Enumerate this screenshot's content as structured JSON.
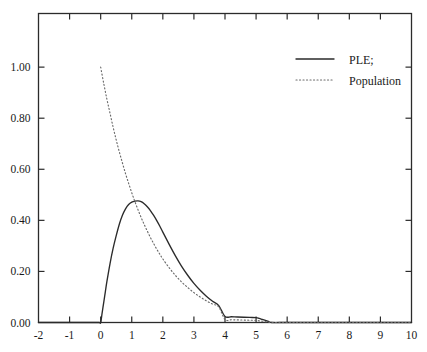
{
  "chart_data": {
    "type": "line",
    "title": "",
    "subtitle": "",
    "xlabel": "",
    "ylabel": "",
    "xlim": [
      -2,
      10
    ],
    "ylim": [
      0,
      1.21
    ],
    "grid": false,
    "legend_position": "top-right",
    "x_ticks": [
      "-2",
      "-1",
      "0",
      "1",
      "2",
      "3",
      "4",
      "5",
      "6",
      "7",
      "8",
      "9",
      "10"
    ],
    "x_tick_values": [
      -2,
      -1,
      0,
      1,
      2,
      3,
      4,
      5,
      6,
      7,
      8,
      9,
      10
    ],
    "y_ticks": [
      "0.00",
      "0.20",
      "0.40",
      "0.60",
      "0.80",
      "1.00"
    ],
    "y_tick_values": [
      0.0,
      0.2,
      0.4,
      0.6,
      0.8,
      1.0
    ],
    "legend": [
      {
        "label": "PLE;",
        "style": "solid"
      },
      {
        "label": "Population",
        "style": "dotted"
      }
    ],
    "series": [
      {
        "name": "PLE;",
        "style": "solid",
        "color": "#2b2b2b",
        "points": [
          [
            -2.0,
            0.0
          ],
          [
            -1.0,
            0.0
          ],
          [
            -0.3,
            0.0
          ],
          [
            -0.05,
            0.0
          ],
          [
            0.0,
            0.0
          ],
          [
            0.05,
            0.04
          ],
          [
            0.1,
            0.08
          ],
          [
            0.15,
            0.12
          ],
          [
            0.2,
            0.16
          ],
          [
            0.3,
            0.23
          ],
          [
            0.4,
            0.29
          ],
          [
            0.5,
            0.34
          ],
          [
            0.6,
            0.385
          ],
          [
            0.7,
            0.42
          ],
          [
            0.8,
            0.445
          ],
          [
            0.9,
            0.462
          ],
          [
            1.0,
            0.471
          ],
          [
            1.1,
            0.475
          ],
          [
            1.2,
            0.476
          ],
          [
            1.3,
            0.473
          ],
          [
            1.4,
            0.465
          ],
          [
            1.5,
            0.453
          ],
          [
            1.6,
            0.438
          ],
          [
            1.7,
            0.42
          ],
          [
            1.8,
            0.4
          ],
          [
            1.9,
            0.378
          ],
          [
            2.0,
            0.354
          ],
          [
            2.2,
            0.307
          ],
          [
            2.4,
            0.262
          ],
          [
            2.6,
            0.221
          ],
          [
            2.8,
            0.185
          ],
          [
            3.0,
            0.153
          ],
          [
            3.2,
            0.126
          ],
          [
            3.4,
            0.103
          ],
          [
            3.6,
            0.083
          ],
          [
            3.8,
            0.066
          ],
          [
            4.0,
            0.0235
          ],
          [
            4.2,
            0.0225
          ],
          [
            4.4,
            0.0215
          ],
          [
            4.6,
            0.0205
          ],
          [
            4.8,
            0.0198
          ],
          [
            5.0,
            0.0192
          ],
          [
            5.1,
            0.016
          ],
          [
            5.2,
            0.012
          ],
          [
            5.3,
            0.008
          ],
          [
            5.4,
            0.004
          ],
          [
            5.5,
            0.0
          ],
          [
            6.0,
            0.0
          ],
          [
            7.0,
            0.0
          ],
          [
            8.0,
            0.0
          ],
          [
            9.0,
            0.0
          ],
          [
            10.0,
            0.0
          ]
        ]
      },
      {
        "name": "Population",
        "style": "dotted",
        "color": "#6a6a6a",
        "points": [
          [
            0.0,
            1.0
          ],
          [
            0.1,
            0.935
          ],
          [
            0.2,
            0.875
          ],
          [
            0.3,
            0.82
          ],
          [
            0.4,
            0.765
          ],
          [
            0.5,
            0.715
          ],
          [
            0.6,
            0.668
          ],
          [
            0.7,
            0.625
          ],
          [
            0.8,
            0.583
          ],
          [
            0.9,
            0.545
          ],
          [
            1.0,
            0.508
          ],
          [
            1.1,
            0.474
          ],
          [
            1.2,
            0.442
          ],
          [
            1.3,
            0.412
          ],
          [
            1.4,
            0.384
          ],
          [
            1.5,
            0.358
          ],
          [
            1.6,
            0.333
          ],
          [
            1.7,
            0.31
          ],
          [
            1.8,
            0.288
          ],
          [
            1.9,
            0.268
          ],
          [
            2.0,
            0.249
          ],
          [
            2.2,
            0.215
          ],
          [
            2.4,
            0.185
          ],
          [
            2.6,
            0.159
          ],
          [
            2.8,
            0.137
          ],
          [
            3.0,
            0.117
          ],
          [
            3.2,
            0.1
          ],
          [
            3.4,
            0.085
          ],
          [
            3.6,
            0.072
          ],
          [
            3.8,
            0.061
          ],
          [
            4.0,
            0.0115
          ],
          [
            4.2,
            0.0108
          ],
          [
            4.4,
            0.0101
          ],
          [
            4.6,
            0.0094
          ],
          [
            4.8,
            0.0088
          ],
          [
            5.0,
            0.0082
          ],
          [
            5.1,
            0.0065
          ],
          [
            5.2,
            0.005
          ],
          [
            5.3,
            0.0034
          ],
          [
            5.4,
            0.0018
          ],
          [
            5.5,
            0.0
          ],
          [
            6.0,
            0.0
          ],
          [
            7.0,
            0.0
          ],
          [
            8.0,
            0.0
          ],
          [
            9.0,
            0.0
          ],
          [
            10.0,
            0.0
          ]
        ]
      }
    ],
    "colors": {
      "axis": "#2b2b2b",
      "solid_series": "#2b2b2b",
      "dotted_series": "#6a6a6a",
      "background": "#ffffff"
    }
  }
}
